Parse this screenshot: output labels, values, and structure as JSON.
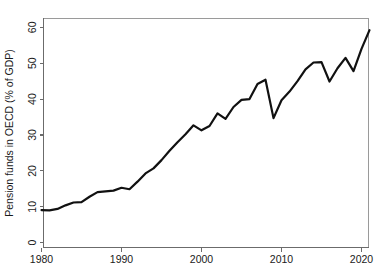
{
  "chart_data": {
    "type": "line",
    "title": "",
    "xlabel": "",
    "ylabel": "Pension funds in OECD (% of GDP)",
    "xlim": [
      1980,
      2021
    ],
    "ylim": [
      0,
      64
    ],
    "grid": false,
    "legend": null,
    "xticks": [
      1980,
      1990,
      2000,
      2010,
      2020
    ],
    "xtick_labels": [
      "1980",
      "1990",
      "2000",
      "2010",
      "2020"
    ],
    "yticks": [
      0,
      10,
      20,
      30,
      40,
      50,
      60
    ],
    "ytick_labels": [
      "0",
      "10",
      "20",
      "30",
      "40",
      "50",
      "60"
    ],
    "series": [
      {
        "name": "Pension funds in OECD (% of GDP)",
        "color": "#111111",
        "x": [
          1980,
          1981,
          1982,
          1983,
          1984,
          1985,
          1986,
          1987,
          1988,
          1989,
          1990,
          1991,
          1992,
          1993,
          1994,
          1995,
          1996,
          1997,
          1998,
          1999,
          2000,
          2001,
          2002,
          2003,
          2004,
          2005,
          2006,
          2007,
          2008,
          2009,
          2010,
          2011,
          2012,
          2013,
          2014,
          2015,
          2016,
          2017,
          2018,
          2019,
          2020,
          2021
        ],
        "values": [
          9.1,
          9.0,
          9.4,
          10.4,
          11.2,
          11.3,
          12.8,
          14.1,
          14.3,
          14.5,
          15.3,
          14.9,
          17.0,
          19.3,
          20.7,
          23.0,
          25.6,
          28.0,
          30.2,
          32.7,
          31.3,
          32.5,
          36.0,
          34.5,
          37.8,
          39.8,
          40.0,
          44.2,
          45.4,
          34.7,
          39.7,
          42.1,
          45.0,
          48.3,
          50.2,
          50.3,
          44.9,
          48.6,
          51.5,
          47.8,
          54.0,
          59.2
        ]
      }
    ]
  },
  "axes": {
    "ylabel": "Pension funds in OECD (% of GDP)"
  }
}
